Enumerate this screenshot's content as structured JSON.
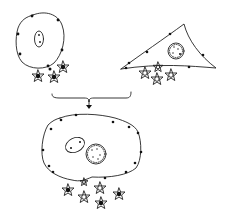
{
  "diagram": {
    "type": "cell-fusion-illustration",
    "colors": {
      "ink": "#222222",
      "background": "#ffffff"
    },
    "cells": [
      {
        "id": "round-cell",
        "shape": "oval",
        "nucleus": "oval-with-two-dots",
        "attached_particles": 4
      },
      {
        "id": "triangular-cell",
        "shape": "triangle",
        "nucleus": "round-speckled",
        "attached_particles": 4
      },
      {
        "id": "fused-cell",
        "shape": "large-oval",
        "nuclei": [
          "oval-with-two-dots",
          "round-speckled"
        ],
        "attached_particles": 7
      }
    ],
    "connector": {
      "type": "bracket-with-down-arrow"
    }
  }
}
